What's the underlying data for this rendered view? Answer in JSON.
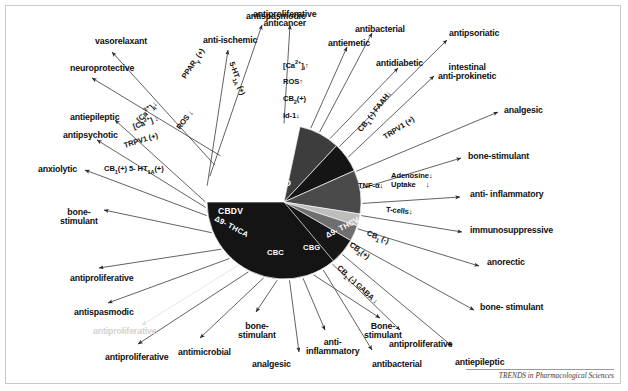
{
  "figure": {
    "title_center": "CBD",
    "credit": "TRENDS in Pharmacological Sciences",
    "frame_color": "#c9c9c9",
    "background": "#ffffff"
  },
  "chart_data": {
    "type": "pie",
    "title": "",
    "subtitle": "",
    "xlabel": "",
    "ylabel": "",
    "legend_position": "on-slice",
    "grid": false,
    "note": "Radial cannabinoid pie with pharmacological-effect spokes; slice sizes estimated from drawn sector angles.",
    "categories": [
      "CBD",
      "Δ9-THCV",
      "CBG",
      "CBC",
      "Δ9-THCA",
      "CBDV"
    ],
    "values": [
      71.5,
      8.5,
      6.5,
      9.0,
      3.0,
      5.5
    ],
    "slices": [
      {
        "label": "CBD",
        "value": 71.5,
        "start_deg": -78,
        "end_deg": 180,
        "color": "#141414",
        "text_color": "#ffffff"
      },
      {
        "label": "Δ9-THCV",
        "value": 8.5,
        "start_deg": -78,
        "end_deg": -47,
        "color": "#3d3d3d",
        "text_color": "#ffffff"
      },
      {
        "label": "CBG",
        "value": 6.5,
        "start_deg": -47,
        "end_deg": -24,
        "color": "#151515",
        "text_color": "#ffffff"
      },
      {
        "label": "CBC",
        "value": 9.0,
        "start_deg": -24,
        "end_deg": 9,
        "color": "#4a4a4a",
        "text_color": "#ffffff"
      },
      {
        "label": "",
        "value": 2.5,
        "start_deg": 9,
        "end_deg": 18,
        "color": "#bdbdbd",
        "text_color": "#ffffff"
      },
      {
        "label": "Δ9-THCA",
        "value": 3.0,
        "start_deg": 18,
        "end_deg": 30,
        "color": "#6f6f6f",
        "text_color": "#ffffff"
      },
      {
        "label": "CBDV",
        "value": 5.5,
        "start_deg": 30,
        "end_deg": 50,
        "color": "#161616",
        "text_color": "#ffffff"
      }
    ]
  },
  "pie_labels": [
    {
      "name": "CBD",
      "text": "CBD"
    },
    {
      "name": "CBDV",
      "text": "CBDV"
    },
    {
      "name": "THCA",
      "text": "Δ9- THCA"
    },
    {
      "name": "CBC",
      "text": "CBC"
    },
    {
      "name": "CBG",
      "text": "CBG"
    },
    {
      "name": "THCV",
      "text": "Δ9- THCV"
    }
  ],
  "effects": [
    {
      "id": "antispasmodic-top",
      "text": "antispasmodic"
    },
    {
      "id": "vasorelaxant",
      "text": "vasorelaxant"
    },
    {
      "id": "neuroprotective",
      "text": "neuroprotective"
    },
    {
      "id": "antiepileptic-left",
      "text": "antiepileptic"
    },
    {
      "id": "antipsychotic",
      "text": "antipsychotic"
    },
    {
      "id": "anxiolytic",
      "text": "anxiolytic"
    },
    {
      "id": "bone-stimulant-left",
      "text": "bone-\nstimulant"
    },
    {
      "id": "antiproliferative-left1",
      "text": "antiproliferative"
    },
    {
      "id": "antispasmodic-left",
      "text": "antispasmodic"
    },
    {
      "id": "antiproliferative-faded",
      "text": "antiproliferative"
    },
    {
      "id": "antiproliferative-left2",
      "text": "antiproliferative"
    },
    {
      "id": "antimicrobial",
      "text": "antimicrobial"
    },
    {
      "id": "bone-stimulant-bottom1",
      "text": "bone-\nstimulant"
    },
    {
      "id": "analgesic-bottom",
      "text": "analgesic"
    },
    {
      "id": "anti-inflammatory-bottom",
      "text": "anti-\ninflammatory"
    },
    {
      "id": "bone-stimulant-bottom2",
      "text": "Bone-\nstimulant"
    },
    {
      "id": "antibacterial-bottom",
      "text": "antibacterial"
    },
    {
      "id": "antiproliferative-bottom",
      "text": "antiproliferative"
    },
    {
      "id": "antiepileptic-bottom",
      "text": "antiepileptic"
    },
    {
      "id": "bone-stimulant-right2",
      "text": "bone- stimulant"
    },
    {
      "id": "anorectic",
      "text": "anorectic"
    },
    {
      "id": "immunosuppressive",
      "text": "immunosuppressive"
    },
    {
      "id": "anti-inflammatory-right",
      "text": "anti- inflammatory"
    },
    {
      "id": "bone-stimulant-right1",
      "text": "bone-stimulant"
    },
    {
      "id": "analgesic-right",
      "text": "analgesic"
    },
    {
      "id": "intestinal-anti-prokinetic",
      "text": "intestinal\nanti-prokinetic"
    },
    {
      "id": "antipsoriatic",
      "text": "antipsoriatic"
    },
    {
      "id": "antidiabetic",
      "text": "antidiabetic"
    },
    {
      "id": "antibacterial-top",
      "text": "antibacterial"
    },
    {
      "id": "antiemetic",
      "text": "antiemetic"
    },
    {
      "id": "antiproliferative-anticancer",
      "text": "antiproliferative\nanticancer"
    },
    {
      "id": "anti-ischemic",
      "text": "anti-ischemic"
    }
  ],
  "mechanisms": [
    {
      "id": "ppar-gamma",
      "html": "PPAR<sub>γ</sub> (+)"
    },
    {
      "id": "ca-down-1",
      "html": "[Ca<sup>2+</sup>]<sub>i</sub>↓"
    },
    {
      "id": "ros-down",
      "html": "ROS ↓"
    },
    {
      "id": "ca-down-2",
      "html": "[Ca<sup>2+</sup>] ↓"
    },
    {
      "id": "trpv1-plus-left",
      "html": "TRPV1 (+)"
    },
    {
      "id": "cb1-5ht1a",
      "html": "CB<sub>1</sub>(+) 5- HT<sub>1A</sub>(+)"
    },
    {
      "id": "5ht1a-plus",
      "html": "5-HT<sub>1A</sub> (+)"
    },
    {
      "id": "ca-up",
      "html": "[Ca<sup>2+</sup>]<sub>i</sub>↑"
    },
    {
      "id": "ros-up",
      "html": "ROS↑"
    },
    {
      "id": "cb2-plus",
      "html": "CB<sub>2</sub>(+)"
    },
    {
      "id": "id1-down",
      "html": "Id-1↓"
    },
    {
      "id": "cb1-faah",
      "html": "CB<sub>1</sub> (-) FAAH↓"
    },
    {
      "id": "trpv1-plus-right",
      "html": "TRPV1 (+)"
    },
    {
      "id": "tnf-alpha-down",
      "html": "TNF-α↓"
    },
    {
      "id": "adenosine-uptake",
      "html": "Adenosine↓\nUptake     ↓"
    },
    {
      "id": "t-cells-down",
      "html": "T-cells↓"
    },
    {
      "id": "cb1-minus",
      "html": "CB<sub>1</sub> (-)"
    },
    {
      "id": "cb2-plus-2",
      "html": "CB<sub>2</sub>(+)"
    },
    {
      "id": "cb1-minus-gaba",
      "html": "CB<sub>1</sub> (-) GABA ↓"
    }
  ]
}
